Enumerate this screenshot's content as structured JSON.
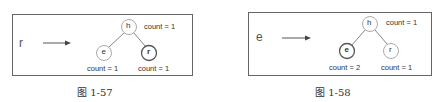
{
  "figures": [
    {
      "input_char": "r",
      "caption": "图 1-57",
      "nodes": {
        "root": {
          "label": "h",
          "count": "count = 1",
          "bold": false
        },
        "left": {
          "label": "e",
          "count": "count = 1",
          "bold": false
        },
        "right": {
          "label": "r",
          "count": "count = 1",
          "bold": true
        }
      }
    },
    {
      "input_char": "e",
      "caption": "图 1-58",
      "nodes": {
        "root": {
          "label": "h",
          "count": "count = 1",
          "bold": false
        },
        "left": {
          "label": "e",
          "count": "count = 2",
          "bold": true
        },
        "right": {
          "label": "r",
          "count": "count = 1",
          "bold": false
        }
      }
    }
  ],
  "colors": {
    "stroke": "#666666",
    "node_stroke": "#999999",
    "node_bold_stroke": "#444444",
    "text": "#333333"
  }
}
